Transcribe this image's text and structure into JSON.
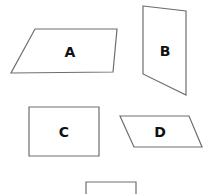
{
  "diagram": {
    "shapes": [
      {
        "id": "A",
        "label": "A",
        "type": "parallelogram",
        "points": "35,29 117,29 113,72 11,73",
        "label_x": 70,
        "label_y": 57
      },
      {
        "id": "B",
        "label": "B",
        "type": "quadrilateral",
        "points": "143,6 186,11 186,95 143,74",
        "label_x": 165,
        "label_y": 56
      },
      {
        "id": "C",
        "label": "C",
        "type": "rectangle",
        "points": "29,107 99,107 99,156 29,156",
        "label_x": 64,
        "label_y": 137
      },
      {
        "id": "D",
        "label": "D",
        "type": "parallelogram",
        "points": "120,116 189,116 202,147 134,147",
        "label_x": 160,
        "label_y": 137
      },
      {
        "id": "E",
        "label": "",
        "type": "rectangle-partial",
        "points": "86,200 86,182 136,182 136,200",
        "label_x": 111,
        "label_y": 200
      }
    ],
    "stroke_color": "#6e6e6e",
    "label_color": "#111111"
  }
}
